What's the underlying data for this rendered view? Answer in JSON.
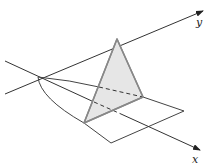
{
  "diagram": {
    "type": "3d-solid-of-known-cross-section",
    "axes": {
      "x_label": "x",
      "y_label": "y"
    },
    "colors": {
      "axis": "#333333",
      "outline": "#444444",
      "triangle_fill": "#e6e6e6",
      "triangle_stroke": "#888888",
      "dashed": "#333333"
    },
    "elements": [
      "x-axis",
      "y-axis",
      "parabolic-region-boundary",
      "equilateral-triangle-cross-section",
      "hidden-dashed-edges",
      "base-square-plane"
    ]
  }
}
